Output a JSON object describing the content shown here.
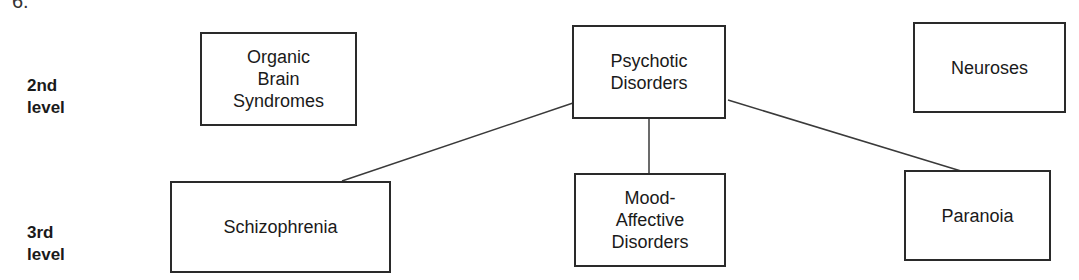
{
  "figure": {
    "number_fragment": "6."
  },
  "levels": [
    {
      "label_line1": "2nd",
      "label_line2": "level"
    },
    {
      "label_line1": "3rd",
      "label_line2": "level"
    }
  ],
  "nodes": {
    "organic_brain_syndromes": {
      "label": "Organic\nBrain\nSyndromes",
      "level": 2
    },
    "psychotic_disorders": {
      "label": "Psychotic\nDisorders",
      "level": 2
    },
    "neuroses": {
      "label": "Neuroses",
      "level": 2
    },
    "schizophrenia": {
      "label": "Schizophrenia",
      "level": 3
    },
    "mood_affective_disorders": {
      "label": "Mood-\nAffective\nDisorders",
      "level": 3
    },
    "paranoia": {
      "label": "Paranoia",
      "level": 3
    }
  },
  "edges": [
    {
      "from": "Psychotic Disorders",
      "to": "Schizophrenia"
    },
    {
      "from": "Psychotic Disorders",
      "to": "Mood-Affective Disorders"
    },
    {
      "from": "Psychotic Disorders",
      "to": "Paranoia"
    }
  ],
  "colors": {
    "stroke": "#2a2a2a",
    "text": "#1a1a1a",
    "background": "#ffffff"
  }
}
